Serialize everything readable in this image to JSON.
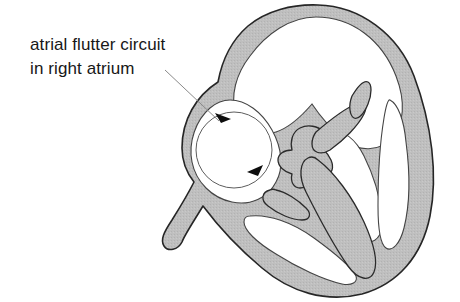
{
  "figure": {
    "background_color": "#ffffff"
  },
  "annotation": {
    "line1": "atrial flutter circuit",
    "line2": "in right atrium",
    "text_color": "#171717",
    "font_size_px": 17,
    "line1_position": {
      "x": 30,
      "y": 50
    },
    "line2_position": {
      "x": 30,
      "y": 74
    },
    "leader_line": {
      "color": "#8a8a8a",
      "width_px": 1,
      "start": {
        "x": 165,
        "y": 70
      },
      "end": {
        "x": 221,
        "y": 123
      }
    }
  },
  "circuit": {
    "label": "atrial-flutter-reentry-circuit",
    "shape": "circle",
    "direction": "clockwise",
    "center": {
      "x": 234,
      "y": 150
    },
    "radius_px": 38,
    "stroke_color": "#5d5d5d",
    "stroke_width_px": 1,
    "arrowheads": [
      {
        "name": "upper-left-arrowhead",
        "x": 221,
        "y": 123,
        "angle_deg": 28
      },
      {
        "name": "lower-right-arrowhead",
        "x": 258,
        "y": 176,
        "angle_deg": 208
      }
    ],
    "arrowhead_color": "#0d0d0d"
  },
  "heart": {
    "wall_fill_color": "#bdbdbd",
    "wall_outline_color": "#262626",
    "chamber_fill_color": "#ffffff",
    "outline_width_px": 1.6,
    "chambers": [
      {
        "name": "right-atrium",
        "position": "upper-left",
        "contains_circuit": true
      },
      {
        "name": "left-atrium",
        "position": "upper-right",
        "contains_circuit": false
      },
      {
        "name": "left-ventricle",
        "position": "center-lower",
        "contains_circuit": false
      },
      {
        "name": "right-ventricle",
        "position": "lower-right",
        "contains_circuit": false
      }
    ],
    "structures": [
      {
        "name": "interventricular-septum"
      },
      {
        "name": "atrioventricular-valve-junction"
      },
      {
        "name": "valve-leaflet-left"
      },
      {
        "name": "valve-leaflet-right"
      },
      {
        "name": "cardiac-apex"
      }
    ]
  }
}
